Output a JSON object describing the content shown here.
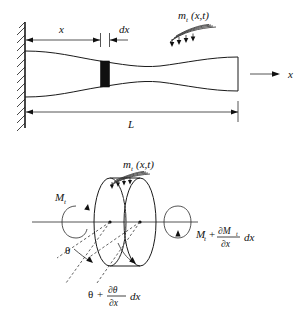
{
  "figure": {
    "background_color": "#ffffff",
    "line_color": "#1a1a1a"
  },
  "top_diagram": {
    "name": "fixed-shaft-overview",
    "labels": {
      "station_x": "x",
      "element_dx": "dx",
      "length_L": "L",
      "axis_x": "x",
      "distributed_torque_symbol": "m",
      "distributed_torque_subscript": "t",
      "distributed_torque_args": "(x,t)"
    },
    "icons": {
      "wall_support": "fixed-wall-hatching-icon",
      "axis_arrow": "right-arrow-icon",
      "distributed_load": "distributed-torque-arrows-icon"
    }
  },
  "bottom_diagram": {
    "name": "shaft-element-free-body",
    "labels": {
      "moment_left_symbol": "M",
      "moment_left_subscript": "t",
      "distributed_torque_symbol": "m",
      "distributed_torque_subscript": "t",
      "distributed_torque_args": "(x,t)",
      "moment_right_base": "M",
      "moment_right_base_subscript": "t",
      "moment_right_plus": "+",
      "moment_right_numerator_partial": "∂M",
      "moment_right_numerator_subscript": "t",
      "moment_right_denominator": "∂x",
      "moment_right_tail": "dx",
      "theta_left": "θ",
      "theta_right_base": "θ",
      "theta_right_plus": "+",
      "theta_right_numerator": "∂θ",
      "theta_right_denominator": "∂x",
      "theta_right_tail": "dx"
    },
    "icons": {
      "left_moment_arrow": "circular-moment-arrow-icon",
      "right_moment_arrow": "circular-moment-arrow-icon",
      "distributed_load": "distributed-torque-arrows-icon",
      "twist_arc_left": "twist-angle-arc-icon",
      "twist_arc_right": "twist-angle-arc-icon",
      "element_cylinder": "cylindrical-element-icon"
    }
  }
}
